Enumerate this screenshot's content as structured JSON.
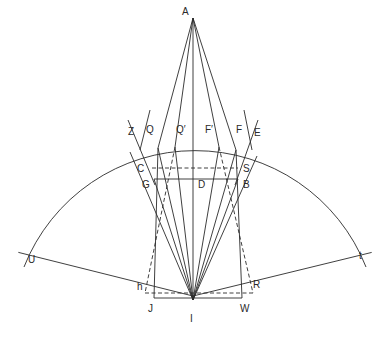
{
  "diagram": {
    "title": "",
    "points": [
      {
        "id": "A",
        "label": "A",
        "x": 193,
        "y": 18,
        "lx": 182,
        "ly": 15
      },
      {
        "id": "I",
        "label": "I",
        "x": 193,
        "y": 300,
        "lx": 190,
        "ly": 322
      },
      {
        "id": "Z",
        "label": "Z",
        "x": 130,
        "y": 152,
        "lx": 128,
        "ly": 135
      },
      {
        "id": "Q",
        "label": "Q",
        "x": 158,
        "y": 148,
        "lx": 146,
        "ly": 133
      },
      {
        "id": "Qp",
        "label": "Q′",
        "x": 175,
        "y": 147,
        "lx": 176,
        "ly": 133
      },
      {
        "id": "Fp",
        "label": "F′",
        "x": 219,
        "y": 147,
        "lx": 205,
        "ly": 133
      },
      {
        "id": "F",
        "label": "F",
        "x": 236,
        "y": 150,
        "lx": 236,
        "ly": 133
      },
      {
        "id": "E",
        "label": "E",
        "x": 257,
        "y": 156,
        "lx": 254,
        "ly": 136
      },
      {
        "id": "C",
        "label": "C",
        "x": 152,
        "y": 168,
        "lx": 137,
        "ly": 172
      },
      {
        "id": "S",
        "label": "S",
        "x": 238,
        "y": 168,
        "lx": 243,
        "ly": 172
      },
      {
        "id": "G",
        "label": "G",
        "x": 154,
        "y": 179,
        "lx": 142,
        "ly": 188
      },
      {
        "id": "D",
        "label": "D",
        "x": 193,
        "y": 179,
        "lx": 198,
        "ly": 188
      },
      {
        "id": "B",
        "label": "B",
        "x": 238,
        "y": 179,
        "lx": 243,
        "ly": 188
      },
      {
        "id": "U",
        "label": "U",
        "x": 28,
        "y": 255,
        "lx": 28,
        "ly": 263
      },
      {
        "id": "t",
        "label": "t",
        "x": 362,
        "y": 255,
        "lx": 359,
        "ly": 259
      },
      {
        "id": "h",
        "label": "h",
        "x": 145,
        "y": 293,
        "lx": 137,
        "ly": 290
      },
      {
        "id": "R",
        "label": "R",
        "x": 253,
        "y": 293,
        "lx": 253,
        "ly": 288
      },
      {
        "id": "J",
        "label": "J",
        "x": 154,
        "y": 298,
        "lx": 148,
        "ly": 312
      },
      {
        "id": "W",
        "label": "W",
        "x": 242,
        "y": 298,
        "lx": 240,
        "ly": 312
      }
    ],
    "arc": {
      "from": "U",
      "to": "t",
      "through_top_y": 148
    },
    "solid_lines": [
      [
        "A",
        "Q"
      ],
      [
        "A",
        "Qp"
      ],
      [
        "A",
        "Fp"
      ],
      [
        "A",
        "F"
      ],
      [
        "A",
        "I"
      ],
      [
        "G",
        "B"
      ],
      [
        "J",
        "W"
      ],
      [
        "U",
        "I"
      ],
      [
        "t",
        "I"
      ],
      [
        "Q",
        "J"
      ],
      [
        "F",
        "W"
      ],
      [
        "Z",
        "I"
      ],
      [
        "E",
        "I"
      ],
      [
        "Q",
        "I"
      ],
      [
        "Qp",
        "I"
      ],
      [
        "Fp",
        "I"
      ],
      [
        "F",
        "I"
      ],
      [
        "G",
        "I"
      ],
      [
        "B",
        "I"
      ]
    ],
    "dashed_lines": [
      [
        "C",
        "S"
      ],
      [
        "h",
        "R"
      ],
      [
        "Qp",
        "h"
      ],
      [
        "Fp",
        "R"
      ]
    ],
    "extra_lines": [
      {
        "x1": 128,
        "y1": 120,
        "x2": 155,
        "y2": 185
      },
      {
        "x1": 258,
        "y1": 120,
        "x2": 235,
        "y2": 185
      },
      {
        "x1": 150,
        "y1": 110,
        "x2": 140,
        "y2": 150
      },
      {
        "x1": 244,
        "y1": 110,
        "x2": 252,
        "y2": 150
      }
    ]
  }
}
